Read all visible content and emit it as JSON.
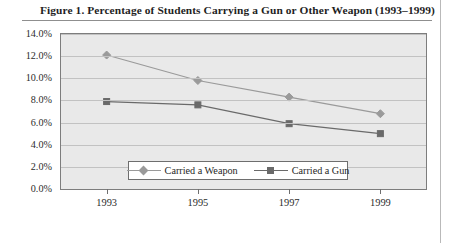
{
  "figure": {
    "title": "Figure 1.  Percentage of Students Carrying a Gun or Other Weapon (1993–1999)"
  },
  "legend": {
    "items": [
      {
        "label": "Carried a Weapon",
        "marker": "diamond-marker",
        "color": "#9a9a9a"
      },
      {
        "label": "Carried a Gun",
        "marker": "square-marker",
        "color": "#6a6a6a"
      }
    ]
  },
  "axes": {
    "y_ticks": [
      "0.0%",
      "2.0%",
      "4.0%",
      "6.0%",
      "8.0%",
      "10.0%",
      "12.0%",
      "14.0%"
    ],
    "x_ticks": [
      "1993",
      "1995",
      "1997",
      "1999"
    ]
  },
  "chart_data": {
    "type": "line",
    "title": "Figure 1.  Percentage of Students Carrying a Gun or Other Weapon (1993–1999)",
    "xlabel": "",
    "ylabel": "",
    "x": [
      1993,
      1995,
      1997,
      1999
    ],
    "categories": [
      "1993",
      "1995",
      "1997",
      "1999"
    ],
    "series": [
      {
        "name": "Carried a Weapon",
        "values": [
          12.1,
          9.8,
          8.3,
          6.8
        ],
        "color": "#9a9a9a",
        "marker": "diamond"
      },
      {
        "name": "Carried a Gun",
        "values": [
          7.9,
          7.6,
          5.9,
          5.0
        ],
        "color": "#6a6a6a",
        "marker": "square"
      }
    ],
    "ylim": [
      0,
      14
    ],
    "ytick_values": [
      0,
      2,
      4,
      6,
      8,
      10,
      12,
      14
    ],
    "ytick_labels": [
      "0.0%",
      "2.0%",
      "4.0%",
      "6.0%",
      "8.0%",
      "10.0%",
      "12.0%",
      "14.0%"
    ],
    "xtick_labels": [
      "1993",
      "1995",
      "1997",
      "1999"
    ],
    "grid": "horizontal",
    "legend_position": "bottom-center",
    "plot_background": "#e9e9e9"
  }
}
